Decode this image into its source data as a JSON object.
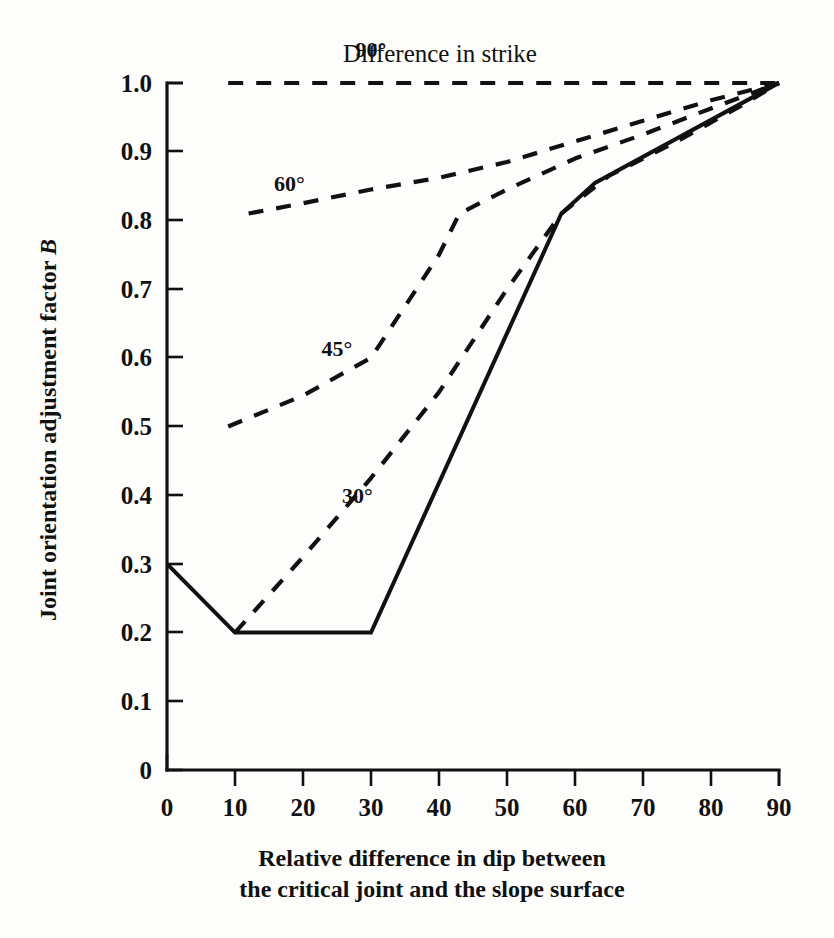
{
  "chart_data": {
    "type": "line",
    "title": "Difference in strike",
    "xlabel": "Relative difference in dip between the critical joint and the slope surface",
    "ylabel": "Joint orientation adjustment factor B",
    "xlabel_line1": "Relative difference in dip between",
    "xlabel_line2": "the critical joint and the slope surface",
    "ylabel_main": "Joint orientation adjustment factor ",
    "ylabel_symbol": "B",
    "xlim": [
      0,
      90
    ],
    "ylim": [
      0,
      1.0
    ],
    "grid": false,
    "legend_position": "inline-curve-labels",
    "x_ticks": [
      0,
      10,
      20,
      30,
      40,
      50,
      60,
      70,
      80,
      90
    ],
    "x_tick_labels": [
      "0",
      "10",
      "20",
      "30",
      "40",
      "50",
      "60",
      "70",
      "80",
      "90"
    ],
    "y_ticks": [
      0,
      0.1,
      0.2,
      0.3,
      0.4,
      0.5,
      0.6,
      0.7,
      0.8,
      0.9,
      1.0
    ],
    "y_tick_labels": [
      "0",
      "0.1",
      "0.2",
      "0.3",
      "0.4",
      "0.5",
      "0.6",
      "0.7",
      "0.8",
      "0.9",
      "1.0"
    ],
    "series": [
      {
        "name": "90°",
        "label": "90°",
        "style": "dashed",
        "label_x": 30,
        "label_y": 1.05,
        "x": [
          9,
          20,
          30,
          40,
          50,
          60,
          70,
          80,
          90
        ],
        "values": [
          1.0,
          1.0,
          1.0,
          1.0,
          1.0,
          1.0,
          1.0,
          1.0,
          1.0
        ]
      },
      {
        "name": "60°",
        "label": "60°",
        "style": "dashed",
        "label_x": 18,
        "label_y": 0.855,
        "x": [
          12,
          20,
          30,
          40,
          50,
          60,
          70,
          80,
          90
        ],
        "values": [
          0.81,
          0.825,
          0.845,
          0.862,
          0.885,
          0.915,
          0.945,
          0.975,
          1.0
        ]
      },
      {
        "name": "45°",
        "label": "45°",
        "style": "dashed",
        "label_x": 25,
        "label_y": 0.615,
        "x": [
          9,
          20,
          30,
          40,
          43,
          50,
          60,
          70,
          80,
          90
        ],
        "values": [
          0.5,
          0.545,
          0.6,
          0.75,
          0.81,
          0.845,
          0.89,
          0.925,
          0.963,
          1.0
        ]
      },
      {
        "name": "30°",
        "label": "30°",
        "style": "dashed",
        "label_x": 28,
        "label_y": 0.4,
        "x": [
          10,
          20,
          30,
          40,
          50,
          58,
          65,
          75,
          85,
          90
        ],
        "values": [
          0.2,
          0.31,
          0.425,
          0.55,
          0.7,
          0.81,
          0.865,
          0.915,
          0.97,
          1.0
        ]
      },
      {
        "name": "solid",
        "label": "",
        "style": "solid",
        "x": [
          0,
          10,
          30,
          58,
          63,
          90
        ],
        "values": [
          0.3,
          0.2,
          0.2,
          0.81,
          0.855,
          1.0
        ]
      }
    ]
  },
  "axes": {
    "tick_label_color": "#111111",
    "line_color": "#111111"
  }
}
